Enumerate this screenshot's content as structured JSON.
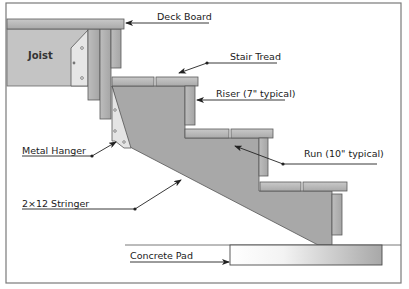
{
  "labels": {
    "deck_board": "Deck Board",
    "joist": "Joist",
    "stair_tread": "Stair Tread",
    "riser": "Riser (7\" typical)",
    "metal_hanger": "Metal Hanger",
    "run": "Run (10\" typical)",
    "stringer": "2×12 Stringer",
    "concrete_pad": "Concrete Pad"
  },
  "colors": {
    "frame": "#6e6e6e",
    "board_fill": "#b9b9b9",
    "stringer_fill": "#a9a9a9",
    "joist_fill": "#c4c4c4",
    "hanger_fill": "#e4e4e4",
    "outline": "#4a4a4a",
    "leader": "#222222"
  }
}
